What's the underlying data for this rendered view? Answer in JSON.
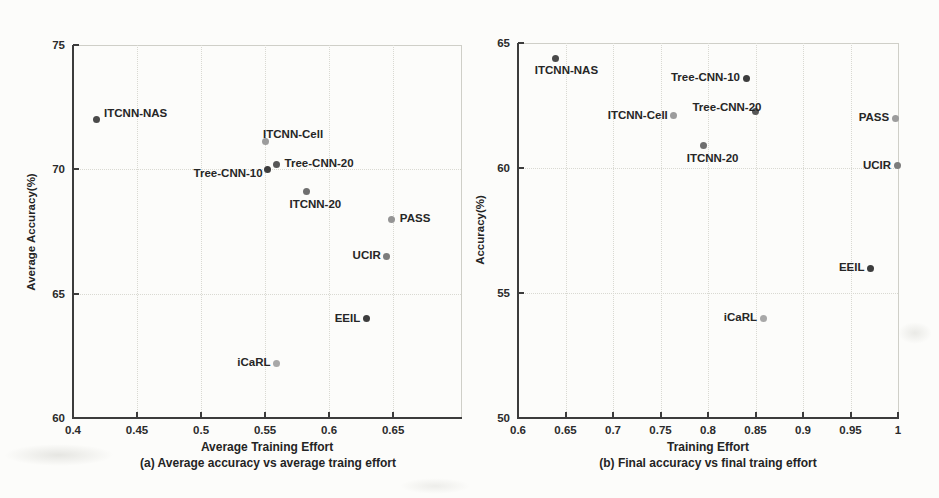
{
  "figure": {
    "background": "#fcfcfa",
    "axis_color": "#3c3c3c",
    "grid_color": "#d9d9d2",
    "text_color": "#242424"
  },
  "chart_data": [
    {
      "type": "scatter",
      "panel": "a",
      "caption": "(a) Average accuracy vs average traing effort",
      "xlabel": "Average Training Effort",
      "ylabel": "Average Accuracy(%)",
      "xlim": [
        0.4,
        0.703
      ],
      "ylim": [
        60,
        75
      ],
      "xticks": [
        0.4,
        0.45,
        0.5,
        0.55,
        0.6,
        0.65
      ],
      "xtick_labels": [
        "0.4",
        "0.45",
        "0.5",
        "0.55",
        "0.6",
        "0.65"
      ],
      "yticks": [
        60,
        65,
        70,
        75
      ],
      "ytick_labels": [
        "60",
        "65",
        "70",
        "75"
      ],
      "grid": true,
      "legend": "none",
      "points": [
        {
          "label": "ITCNN-NAS",
          "x": 0.418,
          "y": 72.0,
          "color": "#4a4a4a",
          "label_pos": "right-up"
        },
        {
          "label": "ITCNN-Cell",
          "x": 0.55,
          "y": 71.1,
          "color": "#9c9c9c",
          "label_pos": "above-right"
        },
        {
          "label": "Tree-CNN-10",
          "x": 0.552,
          "y": 70.0,
          "color": "#3d3d3d",
          "label_pos": "left-down"
        },
        {
          "label": "Tree-CNN-20",
          "x": 0.559,
          "y": 70.2,
          "color": "#575757",
          "label_pos": "right"
        },
        {
          "label": "ITCNN-20",
          "x": 0.582,
          "y": 69.1,
          "color": "#6f6f6f",
          "label_pos": "below-right"
        },
        {
          "label": "PASS",
          "x": 0.649,
          "y": 68.0,
          "color": "#949494",
          "label_pos": "right"
        },
        {
          "label": "UCIR",
          "x": 0.645,
          "y": 66.5,
          "color": "#7d7d7d",
          "label_pos": "left"
        },
        {
          "label": "EEIL",
          "x": 0.629,
          "y": 64.0,
          "color": "#3d3d3d",
          "label_pos": "left"
        },
        {
          "label": "iCaRL",
          "x": 0.559,
          "y": 62.2,
          "color": "#a8a8a8",
          "label_pos": "left"
        }
      ]
    },
    {
      "type": "scatter",
      "panel": "b",
      "caption": "(b) Final accuracy vs final traing effort",
      "xlabel": "Training Effort",
      "ylabel": "Accuracy(%)",
      "xlim": [
        0.6,
        1.0
      ],
      "ylim": [
        50,
        65
      ],
      "xticks": [
        0.6,
        0.65,
        0.7,
        0.75,
        0.8,
        0.85,
        0.9,
        0.95,
        1
      ],
      "xtick_labels": [
        "0.6",
        "0.65",
        "0.7",
        "0.75",
        "0.8",
        "0.85",
        "0.9",
        "0.95",
        "1"
      ],
      "yticks": [
        50,
        55,
        60,
        65
      ],
      "ytick_labels": [
        "50",
        "55",
        "60",
        "65"
      ],
      "grid": true,
      "legend": "none",
      "points": [
        {
          "label": "ITCNN-NAS",
          "x": 0.639,
          "y": 64.4,
          "color": "#4a4a4a",
          "label_pos": "below-right"
        },
        {
          "label": "Tree-CNN-10",
          "x": 0.84,
          "y": 63.6,
          "color": "#3d3d3d",
          "label_pos": "left"
        },
        {
          "label": "Tree-CNN-20",
          "x": 0.85,
          "y": 62.25,
          "color": "#575757",
          "label_pos": "above-left"
        },
        {
          "label": "ITCNN-Cell",
          "x": 0.764,
          "y": 62.1,
          "color": "#9c9c9c",
          "label_pos": "left"
        },
        {
          "label": "PASS",
          "x": 0.997,
          "y": 62.0,
          "color": "#9c9c9c",
          "label_pos": "left"
        },
        {
          "label": "ITCNN-20",
          "x": 0.795,
          "y": 60.9,
          "color": "#6f6f6f",
          "label_pos": "below-right"
        },
        {
          "label": "UCIR",
          "x": 0.999,
          "y": 60.1,
          "color": "#7d7d7d",
          "label_pos": "left"
        },
        {
          "label": "EEIL",
          "x": 0.971,
          "y": 56.0,
          "color": "#3d3d3d",
          "label_pos": "left"
        },
        {
          "label": "iCaRL",
          "x": 0.858,
          "y": 54.0,
          "color": "#a8a8a8",
          "label_pos": "left"
        }
      ]
    }
  ]
}
